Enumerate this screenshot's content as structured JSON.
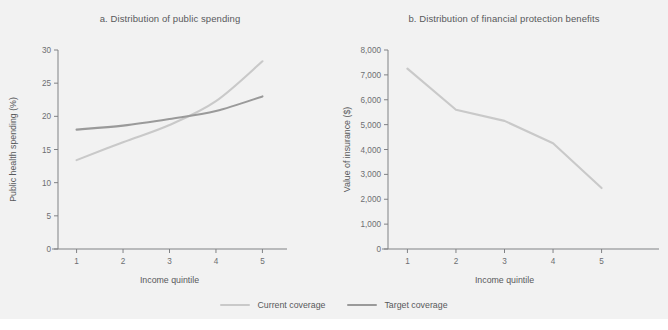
{
  "figure": {
    "background_color": "#f2f2f2",
    "text_color": "#58595b"
  },
  "legend": {
    "position": "bottom-center",
    "items": [
      {
        "label": "Current coverage",
        "color": "#c9c9c9",
        "swatch_name": "legend-swatch-current-coverage"
      },
      {
        "label": "Target coverage",
        "color": "#9a9a9a",
        "swatch_name": "legend-swatch-target-coverage"
      }
    ]
  },
  "chart_data": [
    {
      "type": "line",
      "panel": "a",
      "title": "a. Distribution of public spending",
      "xlabel": "Income quintile",
      "ylabel": "Public health spending (%)",
      "categories": [
        "1",
        "2",
        "3",
        "4",
        "5"
      ],
      "x": [
        1,
        2,
        3,
        4,
        5
      ],
      "xlim": [
        0.6,
        5.4
      ],
      "ylim": [
        0,
        30
      ],
      "yticks": [
        0,
        5,
        10,
        15,
        20,
        25,
        30
      ],
      "ytick_labels": [
        "0",
        "5",
        "10",
        "15",
        "20",
        "25",
        "30"
      ],
      "xticks": [
        1,
        2,
        3,
        4,
        5
      ],
      "xtick_labels": [
        "1",
        "2",
        "3",
        "4",
        "5"
      ],
      "grid": false,
      "series": [
        {
          "name": "Current coverage",
          "color": "#c9c9c9",
          "values": [
            13.4,
            16.1,
            18.7,
            22.3,
            28.3
          ]
        },
        {
          "name": "Target coverage",
          "color": "#9a9a9a",
          "values": [
            18.0,
            18.6,
            19.6,
            20.8,
            23.0
          ]
        }
      ]
    },
    {
      "type": "line",
      "panel": "b",
      "title": "b. Distribution of financial protection benefits",
      "xlabel": "Income quintile",
      "ylabel": "Value of insurance ($)",
      "categories": [
        "1",
        "2",
        "3",
        "4",
        "5"
      ],
      "x": [
        1,
        2,
        3,
        4,
        5
      ],
      "xlim": [
        0.6,
        5.4
      ],
      "ylim": [
        0,
        8000
      ],
      "yticks": [
        0,
        1000,
        2000,
        3000,
        4000,
        5000,
        6000,
        7000,
        8000
      ],
      "ytick_labels": [
        "0",
        "1,000",
        "2,000",
        "3,000",
        "4,000",
        "5,000",
        "6,000",
        "7,000",
        "8,000"
      ],
      "xticks": [
        1,
        2,
        3,
        4,
        5
      ],
      "xtick_labels": [
        "1",
        "2",
        "3",
        "4",
        "5"
      ],
      "grid": false,
      "series": [
        {
          "name": "Value of insurance",
          "color": "#c9c9c9",
          "values": [
            7250,
            5600,
            5150,
            4250,
            2450
          ]
        }
      ]
    }
  ]
}
